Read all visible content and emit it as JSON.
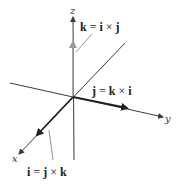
{
  "diagram": {
    "axes": {
      "x": {
        "label": "x"
      },
      "y": {
        "label": "y"
      },
      "z": {
        "label": "z"
      }
    },
    "vectors": [
      {
        "name": "i",
        "equation": {
          "lhs": "i",
          "eq": "=",
          "a": "j",
          "op": "×",
          "b": "k"
        }
      },
      {
        "name": "j",
        "equation": {
          "lhs": "j",
          "eq": "=",
          "a": "k",
          "op": "×",
          "b": "i"
        }
      },
      {
        "name": "k",
        "equation": {
          "lhs": "k",
          "eq": "=",
          "a": "i",
          "op": "×",
          "b": "j"
        }
      }
    ],
    "colors": {
      "axis": "#3a3a3a",
      "vector": "#222222",
      "k_vector": "#9a9a9a",
      "leader": "#666666",
      "background": "#ffffff"
    }
  }
}
